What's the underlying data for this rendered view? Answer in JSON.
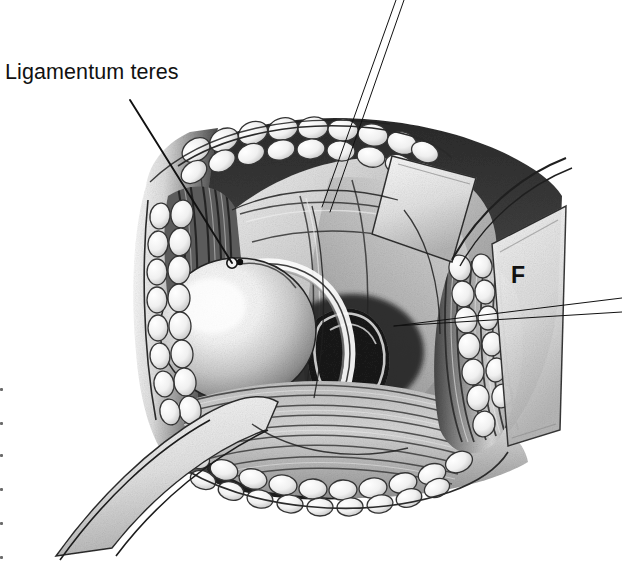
{
  "figure": {
    "kind": "surgical-anatomical-illustration",
    "medium": "grayscale pen-and-ink with graphite tonal shading",
    "background_color": "#ffffff",
    "ink_color": "#111111",
    "width": 622,
    "height": 569
  },
  "labels": {
    "ligamentum_teres": "Ligamentum teres",
    "f_marker": "F"
  },
  "leaders": [
    {
      "name": "ligamentum-teres-leader",
      "from": [
        130,
        100
      ],
      "to": [
        232,
        263
      ],
      "weight": 1.9
    },
    {
      "name": "upper-right-leader-a",
      "from": [
        396,
        0
      ],
      "to": [
        322,
        207
      ],
      "weight": 1.0
    },
    {
      "name": "upper-right-leader-b",
      "from": [
        404,
        0
      ],
      "to": [
        330,
        212
      ],
      "weight": 1.0
    },
    {
      "name": "f-leader-a",
      "from": [
        622,
        298
      ],
      "to": [
        394,
        326
      ],
      "weight": 1.0
    },
    {
      "name": "f-leader-b",
      "from": [
        622,
        312
      ],
      "to": [
        394,
        326
      ],
      "weight": 1.0
    }
  ],
  "structures": [
    {
      "name": "upper-wound-edge-fat",
      "description": "arcing column of subcutaneous fat lobules along the superior wound margin"
    },
    {
      "name": "left-wound-edge-fat",
      "description": "vertical column of fat lobules on the left abdominal wall flap"
    },
    {
      "name": "right-wound-edge-fat",
      "description": "column of fat lobules on the right abdominal wall flap"
    },
    {
      "name": "lower-wound-edge-fat",
      "description": "row of fat lobules forming the inferior wound margin"
    },
    {
      "name": "round-organ",
      "description": "large highlighted spherical organ (bladder/uterine body) at left of the field"
    },
    {
      "name": "round-ligament-band",
      "description": "pale curved ligamentous band sweeping around the right of the round organ"
    },
    {
      "name": "internal-ring-foramen",
      "description": "dark oval opening / ring medial and inferior to the round organ"
    },
    {
      "name": "striated-muscle-floor",
      "description": "horizontally striated muscle sheet across the lower field"
    },
    {
      "name": "right-muscle-striations",
      "description": "vertically striated muscle band on the right wall of the field"
    },
    {
      "name": "left-muscle-striations",
      "description": "dark vertical muscle striations on the left wall of the field"
    },
    {
      "name": "upper-retractor-blade",
      "description": "pale quadrilateral retractor blade entering from the upper right"
    },
    {
      "name": "right-retractor-blade",
      "description": "pale retractor blade along the right margin"
    },
    {
      "name": "lower-left-retractor-blade",
      "description": "pale retractor blade entering from the lower left"
    },
    {
      "name": "peritoneal-fold",
      "description": "broad pale peritoneal fold draped across the centre of the field"
    }
  ],
  "edge_artifacts": {
    "name": "scan-margin-dots",
    "count": 6,
    "color": "#6a6a6a"
  }
}
